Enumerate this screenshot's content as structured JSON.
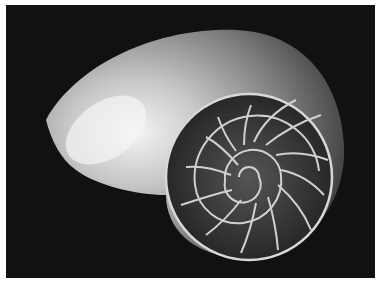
{
  "image": {
    "subject": "Nautilus shell cross-section",
    "description": "Black-and-white photograph of a halved chambered nautilus shell on a black background, showing the logarithmic spiral of chambers",
    "colors": {
      "border": "#ffffff",
      "background": "#111111",
      "shell_highlight": "#f2f2f2",
      "shell_mid": "#9a9a9a",
      "shell_dark": "#3a3a3a"
    }
  }
}
